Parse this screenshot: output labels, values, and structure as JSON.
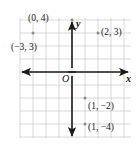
{
  "figure": {
    "name": "coordinate-plane",
    "background": "#ffffff",
    "grid_color": "#c8c8c8",
    "axis_color": "#1a1a1a",
    "point_color": "#8c8c8c",
    "label_color": "#1a1a1a"
  },
  "axes": {
    "x_label": "x",
    "y_label": "y",
    "origin_label": "O",
    "origin_px": {
      "x": 72,
      "y": 72
    },
    "unit_px": 13,
    "x_range": [
      -4,
      4
    ],
    "y_range": [
      -5,
      4
    ]
  },
  "chart_data": {
    "type": "scatter",
    "title": "",
    "xlabel": "x",
    "ylabel": "y",
    "xlim": [
      -4,
      4
    ],
    "ylim": [
      -5,
      4
    ],
    "grid": true,
    "legend": "none",
    "points": [
      {
        "label": "(0, 4)",
        "x": 0,
        "y": 4,
        "label_dx": -44,
        "label_dy": -6
      },
      {
        "label": "(−3, 3)",
        "x": -3,
        "y": 3,
        "label_dx": -22,
        "label_dy": 10
      },
      {
        "label": "(2, 3)",
        "x": 2,
        "y": 3,
        "label_dx": 3,
        "label_dy": -5
      },
      {
        "label": "(1, −2)",
        "x": 1,
        "y": -2,
        "label_dx": 3,
        "label_dy": 4
      },
      {
        "label": "(1, −4)",
        "x": 1,
        "y": -4,
        "label_dx": 3,
        "label_dy": -1
      }
    ]
  }
}
